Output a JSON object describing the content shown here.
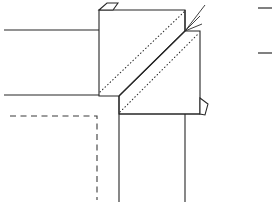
{
  "figure": {
    "canvas": {
      "width": 274,
      "height": 203
    },
    "background_color": "#ffffff",
    "line_color": "#262626",
    "hidden_line_color": "#3b3b3b",
    "dotted_line_color": "#2b2b2b"
  },
  "geometry": {
    "upper_left_rail": {
      "label": "upper horizontal rail",
      "x1": 4,
      "y1": 30,
      "x2": 99,
      "y2": 30
    },
    "lower_left_rail": {
      "label": "lower horizontal rail",
      "x1": 4,
      "y1": 95,
      "x2": 120,
      "y2": 95
    },
    "hidden_outline": {
      "label": "hidden dashed outline",
      "horizontal": {
        "x1": 10,
        "y1": 116,
        "x2": 97,
        "y2": 116
      },
      "vertical": {
        "x1": 97,
        "y1": 116,
        "x2": 97,
        "y2": 200
      }
    },
    "upper_box": {
      "label": "upper left block face",
      "left": 99,
      "top": 10,
      "right": 185,
      "bottom": 96
    },
    "lower_box": {
      "label": "lower right block face",
      "left": 119,
      "top": 31,
      "right": 200,
      "bottom": 114
    },
    "fold_diagonal": {
      "label": "diagonal fold edge",
      "x1": 119,
      "y1": 96,
      "x2": 185,
      "y2": 31
    },
    "dotted_upper": {
      "label": "upper hidden diagonal",
      "x1": 100,
      "y1": 92,
      "x2": 184,
      "y2": 12
    },
    "dotted_lower": {
      "label": "lower hidden diagonal",
      "x1": 120,
      "y1": 112,
      "x2": 199,
      "y2": 33
    },
    "post_left": {
      "label": "left vertical post",
      "x1": 119,
      "y1": 96,
      "x2": 119,
      "y2": 202
    },
    "post_right": {
      "label": "right vertical post",
      "x1": 185,
      "y1": 114,
      "x2": 185,
      "y2": 202
    },
    "top_flap": {
      "label": "top left triangular flap",
      "points": "99,10 107,3 118,3 113,10"
    },
    "bottom_flap": {
      "label": "bottom right triangular flap",
      "points": "200,98 208,104 205,115 200,114"
    },
    "leader_arrow": {
      "label": "leader arrow to joint",
      "strokes": [
        "M 185 31 L 205 5",
        "M 185 31 L 200 16",
        "M 185 31 L 202 24"
      ]
    },
    "right_margin_ticks": [
      {
        "label": "upper margin tick",
        "x1": 258,
        "y1": 8,
        "x2": 272,
        "y2": 8
      },
      {
        "label": "lower margin tick",
        "x1": 258,
        "y1": 53,
        "x2": 272,
        "y2": 53
      }
    ]
  }
}
